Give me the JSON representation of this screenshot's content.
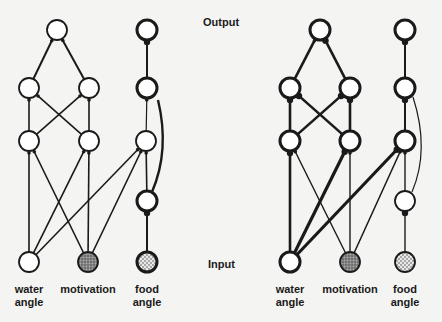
{
  "labels": {
    "output": "Output",
    "input": "Input"
  },
  "colors": {
    "ink": "#1a1a1a",
    "background": "#f4f4f2",
    "motivation_fill": "#8a8a8a",
    "food_fill": "#c8c8c8"
  },
  "networks": [
    {
      "name": "left",
      "input_labels": [
        {
          "id": "water",
          "line1": "water",
          "line2": "angle",
          "x": 29
        },
        {
          "id": "motivation",
          "line1": "motivation",
          "line2": "",
          "x": 88
        },
        {
          "id": "food",
          "line1": "food",
          "line2": "angle",
          "x": 147
        }
      ],
      "nodes": [
        {
          "id": "o",
          "x": 57,
          "y": 30,
          "fill": "none",
          "bold": false
        },
        {
          "id": "h2a",
          "x": 29,
          "y": 88,
          "fill": "none",
          "bold": false
        },
        {
          "id": "h2b",
          "x": 89,
          "y": 88,
          "fill": "none",
          "bold": false
        },
        {
          "id": "h3a",
          "x": 29,
          "y": 141,
          "fill": "none",
          "bold": false
        },
        {
          "id": "h3b",
          "x": 89,
          "y": 141,
          "fill": "none",
          "bold": false
        },
        {
          "id": "f1",
          "x": 147,
          "y": 30,
          "fill": "none",
          "bold": true
        },
        {
          "id": "f2",
          "x": 147,
          "y": 88,
          "fill": "none",
          "bold": true
        },
        {
          "id": "f3",
          "x": 146,
          "y": 141,
          "fill": "none",
          "bold": false
        },
        {
          "id": "f4",
          "x": 147,
          "y": 201,
          "fill": "none",
          "bold": true
        },
        {
          "id": "iw",
          "x": 29,
          "y": 262,
          "fill": "none",
          "bold": false
        },
        {
          "id": "im",
          "x": 88,
          "y": 262,
          "fill": "motivation",
          "bold": false
        },
        {
          "id": "if",
          "x": 147,
          "y": 262,
          "fill": "food",
          "bold": true
        }
      ],
      "edges": [
        {
          "from": "h2a",
          "to": "o",
          "w": 2,
          "dot": false
        },
        {
          "from": "h2b",
          "to": "o",
          "w": 2,
          "dot": false
        },
        {
          "from": "h3a",
          "to": "h2a",
          "w": 1.6,
          "dot": false
        },
        {
          "from": "h3b",
          "to": "h2b",
          "w": 1.6,
          "dot": false
        },
        {
          "from": "h3a",
          "to": "h2b",
          "w": 1.6,
          "dot": false
        },
        {
          "from": "h3b",
          "to": "h2a",
          "w": 1.6,
          "dot": false
        },
        {
          "from": "f2",
          "to": "f1",
          "w": 2,
          "dot": true
        },
        {
          "from": "f3",
          "to": "f2",
          "w": 1.2,
          "dot": false
        },
        {
          "from": "iw",
          "to": "h3a",
          "w": 1.6,
          "dot": false
        },
        {
          "from": "iw",
          "to": "h3b",
          "w": 1.6,
          "dot": false
        },
        {
          "from": "iw",
          "to": "f3",
          "w": 1.6,
          "dot": false
        },
        {
          "from": "im",
          "to": "h3a",
          "w": 1.6,
          "dot": false
        },
        {
          "from": "im",
          "to": "h3b",
          "w": 1.6,
          "dot": false
        },
        {
          "from": "im",
          "to": "f3",
          "w": 1.6,
          "dot": false
        },
        {
          "from": "f4",
          "to": "f3",
          "w": 1.6,
          "dot": false
        },
        {
          "from": "if",
          "to": "f4",
          "w": 2,
          "dot": true
        }
      ],
      "curves": [
        {
          "d": "M158,100 Q170,150 152,192",
          "w": 2.4
        }
      ]
    },
    {
      "name": "right",
      "input_labels": [
        {
          "id": "water",
          "line1": "water",
          "line2": "angle",
          "x": 290
        },
        {
          "id": "motivation",
          "line1": "motivation",
          "line2": "",
          "x": 350
        },
        {
          "id": "food",
          "line1": "food",
          "line2": "angle",
          "x": 405
        }
      ],
      "nodes": [
        {
          "id": "o",
          "x": 320,
          "y": 30,
          "fill": "none",
          "bold": true
        },
        {
          "id": "h2a",
          "x": 290,
          "y": 88,
          "fill": "none",
          "bold": true
        },
        {
          "id": "h2b",
          "x": 350,
          "y": 88,
          "fill": "none",
          "bold": true
        },
        {
          "id": "h3a",
          "x": 290,
          "y": 141,
          "fill": "none",
          "bold": true
        },
        {
          "id": "h3b",
          "x": 350,
          "y": 141,
          "fill": "none",
          "bold": true
        },
        {
          "id": "f1",
          "x": 405,
          "y": 30,
          "fill": "none",
          "bold": true
        },
        {
          "id": "f2",
          "x": 405,
          "y": 88,
          "fill": "none",
          "bold": true
        },
        {
          "id": "f3",
          "x": 405,
          "y": 141,
          "fill": "none",
          "bold": true
        },
        {
          "id": "f4",
          "x": 405,
          "y": 201,
          "fill": "none",
          "bold": false
        },
        {
          "id": "iw",
          "x": 290,
          "y": 262,
          "fill": "none",
          "bold": true
        },
        {
          "id": "im",
          "x": 350,
          "y": 262,
          "fill": "motivation",
          "bold": false
        },
        {
          "id": "if",
          "x": 405,
          "y": 262,
          "fill": "food",
          "bold": false
        }
      ],
      "edges": [
        {
          "from": "h2a",
          "to": "o",
          "w": 2.6,
          "dot": false
        },
        {
          "from": "h2b",
          "to": "o",
          "w": 2.6,
          "dot": true
        },
        {
          "from": "h3a",
          "to": "h2a",
          "w": 2.6,
          "dot": true
        },
        {
          "from": "h3b",
          "to": "h2b",
          "w": 2.6,
          "dot": true
        },
        {
          "from": "h3a",
          "to": "h2b",
          "w": 2.6,
          "dot": true
        },
        {
          "from": "h3b",
          "to": "h2a",
          "w": 2.6,
          "dot": true
        },
        {
          "from": "f2",
          "to": "f1",
          "w": 2,
          "dot": true
        },
        {
          "from": "f3",
          "to": "f2",
          "w": 2,
          "dot": true
        },
        {
          "from": "iw",
          "to": "h3a",
          "w": 2.6,
          "dot": true
        },
        {
          "from": "iw",
          "to": "h3b",
          "w": 3.2,
          "dot": true
        },
        {
          "from": "iw",
          "to": "f3",
          "w": 3.2,
          "dot": true
        },
        {
          "from": "im",
          "to": "h3a",
          "w": 1.4,
          "dot": false
        },
        {
          "from": "im",
          "to": "h3b",
          "w": 1.4,
          "dot": false
        },
        {
          "from": "im",
          "to": "f3",
          "w": 1.4,
          "dot": false
        },
        {
          "from": "f4",
          "to": "f3",
          "w": 1.4,
          "dot": false
        },
        {
          "from": "if",
          "to": "f4",
          "w": 1.4,
          "dot": true
        }
      ],
      "curves": [
        {
          "d": "M413,97 Q430,150 412,192",
          "w": 1.2
        }
      ]
    }
  ]
}
